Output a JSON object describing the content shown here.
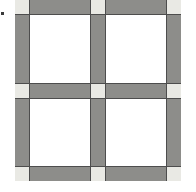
{
  "figure": {
    "type": "grid-diagram",
    "canvas": {
      "width": 196,
      "height": 192,
      "background": "#ffffff"
    },
    "block": {
      "left": 15,
      "top": 0,
      "width": 166,
      "height": 181,
      "sash_thickness": 14,
      "outline_width": 1
    },
    "colors": {
      "background": "#ffffff",
      "sashing_band": "#8d8d8a",
      "cornerstone": "#e9e9e4",
      "patch_square": "#ffffff",
      "outline_ink": "#4d4d4d",
      "speck": "#3a3a3a"
    },
    "grid": {
      "rows": 5,
      "columns": 5,
      "column_kinds": [
        "sash",
        "cell",
        "sash",
        "cell",
        "sash"
      ],
      "row_kinds": [
        "sash",
        "cell",
        "sash",
        "cell",
        "sash"
      ],
      "cells": [
        [
          "cornerstone",
          "sash",
          "cornerstone",
          "sash",
          "cornerstone"
        ],
        [
          "sash",
          "patch",
          "sash",
          "patch",
          "sash"
        ],
        [
          "cornerstone",
          "sash",
          "cornerstone",
          "sash",
          "cornerstone"
        ],
        [
          "sash",
          "patch",
          "sash",
          "patch",
          "sash"
        ],
        [
          "cornerstone",
          "sash",
          "cornerstone",
          "sash",
          "cornerstone"
        ]
      ]
    },
    "cornerstone_count": 9,
    "patch_count": 4,
    "sash_count": 12,
    "speck": {
      "left": 1,
      "top": 12,
      "width": 3,
      "height": 3
    }
  }
}
